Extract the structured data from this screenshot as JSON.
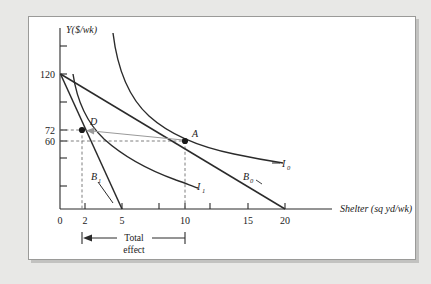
{
  "figure": {
    "background_color": "#e8e8e6",
    "panel_color": "#ffffff",
    "panel_border_color": "#9a9a98",
    "ink_color": "#2b2b2b",
    "guide_color": "#8c8c8c",
    "arrow_color": "#9a9a9a"
  },
  "axes": {
    "y_axis_label": "Y($/wk)",
    "x_axis_label": "Shelter (sq yd/wk)",
    "x_ticks": [
      {
        "value": 0,
        "label": "0"
      },
      {
        "value": 2,
        "label": "2"
      },
      {
        "value": 5,
        "label": "5"
      },
      {
        "value": 10,
        "label": "10"
      },
      {
        "value": 15,
        "label": "15"
      },
      {
        "value": 20,
        "label": "20"
      }
    ],
    "y_ticks": [
      {
        "value": 120,
        "label": "120"
      },
      {
        "value": 72,
        "label": "72"
      },
      {
        "value": 60,
        "label": "60"
      }
    ],
    "x_range": [
      0,
      23
    ],
    "y_range": [
      0,
      160
    ]
  },
  "curves": [
    {
      "name": "I0",
      "label": "I",
      "subscript": "0",
      "type": "indifference-curve",
      "label_pos": {
        "x": 21.2,
        "y": 38
      }
    },
    {
      "name": "I1",
      "label": "I",
      "subscript": "1",
      "type": "indifference-curve",
      "label_pos": {
        "x": 12.9,
        "y": 21
      }
    },
    {
      "name": "B0",
      "label": "B",
      "subscript": "0",
      "type": "budget-line",
      "intercept_y": 120,
      "intercept_x": 20,
      "label_pos": {
        "x": 17.1,
        "y": 28
      }
    },
    {
      "name": "B1",
      "label": "B",
      "subscript": "1",
      "type": "budget-line",
      "intercept_y": 120,
      "intercept_x": 5,
      "label_pos": {
        "x": 3.6,
        "y": 29
      }
    }
  ],
  "points": [
    {
      "name": "A",
      "label": "A",
      "x": 10,
      "y": 60
    },
    {
      "name": "D",
      "label": "D",
      "x": 2,
      "y": 72
    }
  ],
  "annotation": {
    "total_effect_line1": "Total",
    "total_effect_line2": "effect",
    "from_x": 2,
    "to_x": 10
  }
}
